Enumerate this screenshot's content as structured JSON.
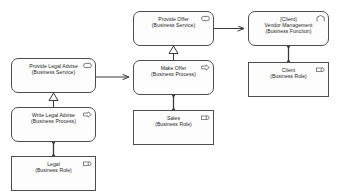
{
  "diagram": {
    "type": "archimate-business-layer-diagram",
    "background": "#ffffff",
    "stroke": "#4d4d4d",
    "fill": "#fdfdfd",
    "text_color": "#1b1b1b"
  },
  "nodes": [
    {
      "id": "provide-offer",
      "label": "Provide Offer",
      "sublabel": "(Business Service)",
      "element_type": "Business Service",
      "icon": "business-service-icon",
      "shape": "rounded",
      "x": 133,
      "y": 11,
      "w": 81,
      "h": 35
    },
    {
      "id": "vendor-management",
      "label": "Vendor Management",
      "sublabel": "(Business Function)",
      "prefix": "[Client]",
      "element_type": "Business Function",
      "icon": "business-function-icon",
      "shape": "rounded",
      "x": 248,
      "y": 11,
      "w": 81,
      "h": 35
    },
    {
      "id": "provide-legal-advise",
      "label": "Provide Legal Advise",
      "sublabel": "(Business Service)",
      "element_type": "Business Service",
      "icon": "business-service-icon",
      "shape": "rounded",
      "x": 11,
      "y": 58,
      "w": 85,
      "h": 35
    },
    {
      "id": "make-offer",
      "label": "Make Offer",
      "sublabel": "(Business Process)",
      "element_type": "Business Process",
      "icon": "business-process-icon",
      "shape": "rounded",
      "x": 133,
      "y": 60,
      "w": 81,
      "h": 35
    },
    {
      "id": "client",
      "label": "Client",
      "sublabel": "(Business Role)",
      "element_type": "Business Role",
      "icon": "business-role-icon",
      "shape": "square",
      "x": 248,
      "y": 62,
      "w": 81,
      "h": 35
    },
    {
      "id": "write-legal-advise",
      "label": "Write Legal Advise",
      "sublabel": "(Business Process)",
      "element_type": "Business Process",
      "icon": "business-process-icon",
      "shape": "rounded",
      "x": 11,
      "y": 107,
      "w": 85,
      "h": 35
    },
    {
      "id": "sales",
      "label": "Sales",
      "sublabel": "(Business Role)",
      "element_type": "Business Role",
      "icon": "business-role-icon",
      "shape": "square",
      "x": 133,
      "y": 110,
      "w": 81,
      "h": 35
    },
    {
      "id": "legal",
      "label": "Legal",
      "sublabel": "(Business Role)",
      "element_type": "Business Role",
      "icon": "business-role-icon",
      "shape": "square",
      "x": 11,
      "y": 156,
      "w": 85,
      "h": 35
    }
  ],
  "edges": [
    {
      "id": "edge-provide-offer-to-vendor-management",
      "from": "provide-offer",
      "to": "vendor-management",
      "relationship": "serving",
      "arrowhead": "open-arrow"
    },
    {
      "id": "edge-make-offer-realizes-provide-offer",
      "from": "make-offer",
      "to": "provide-offer",
      "relationship": "realization",
      "arrowhead": "hollow-triangle"
    },
    {
      "id": "edge-provide-legal-advise-to-make-offer",
      "from": "provide-legal-advise",
      "to": "make-offer",
      "relationship": "serving",
      "arrowhead": "open-arrow"
    },
    {
      "id": "edge-write-legal-advise-realizes-provide-legal-advise",
      "from": "write-legal-advise",
      "to": "provide-legal-advise",
      "relationship": "realization",
      "arrowhead": "hollow-triangle"
    },
    {
      "id": "edge-sales-assigned-to-make-offer",
      "from": "sales",
      "to": "make-offer",
      "relationship": "assignment",
      "arrowhead": "ball-end"
    },
    {
      "id": "edge-legal-assigned-to-write-legal-advise",
      "from": "legal",
      "to": "write-legal-advise",
      "relationship": "assignment",
      "arrowhead": "ball-end"
    },
    {
      "id": "edge-client-assigned-to-vendor-management",
      "from": "client",
      "to": "vendor-management",
      "relationship": "assignment",
      "arrowhead": "ball-end"
    }
  ]
}
